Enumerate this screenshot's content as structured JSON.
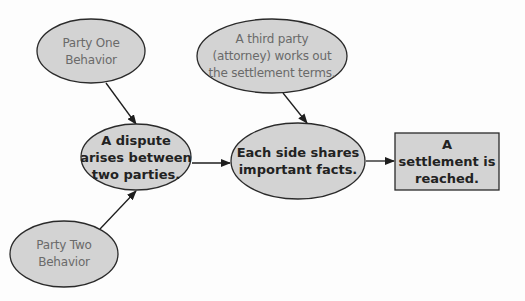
{
  "diagram": {
    "colors": {
      "node_fill": "#d3d3d3",
      "node_stroke": "#2a2a2a",
      "arrow": "#1e1e1e",
      "light_text": "#6a6a6a",
      "bold_text": "#222222"
    },
    "nodes": [
      {
        "id": "party_one",
        "shape": "ellipse",
        "style": "light",
        "lines": [
          "Party One",
          "Behavior"
        ]
      },
      {
        "id": "third_party",
        "shape": "ellipse",
        "style": "light",
        "lines": [
          "A third party",
          "(attorney) works out",
          "the settlement terms."
        ]
      },
      {
        "id": "dispute",
        "shape": "ellipse",
        "style": "bold",
        "lines": [
          "A dispute",
          "arises between",
          "two parties."
        ]
      },
      {
        "id": "each_side",
        "shape": "ellipse",
        "style": "bold",
        "lines": [
          "Each side shares",
          "important facts."
        ]
      },
      {
        "id": "settlement",
        "shape": "rectangle",
        "style": "bold",
        "lines": [
          "A",
          "settlement is",
          "reached."
        ]
      },
      {
        "id": "party_two",
        "shape": "ellipse",
        "style": "light",
        "lines": [
          "Party Two",
          "Behavior"
        ]
      }
    ],
    "edges": [
      {
        "from": "party_one",
        "to": "dispute"
      },
      {
        "from": "party_two",
        "to": "dispute"
      },
      {
        "from": "dispute",
        "to": "each_side"
      },
      {
        "from": "third_party",
        "to": "each_side"
      },
      {
        "from": "each_side",
        "to": "settlement"
      }
    ]
  }
}
